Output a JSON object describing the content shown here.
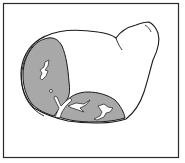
{
  "figure": {
    "colors": {
      "background": "#ffffff",
      "frame": "#2a2a2a",
      "outline": "#1a1a1a",
      "cut_face": "#a8a8a8",
      "cavity": "#ffffff"
    }
  }
}
